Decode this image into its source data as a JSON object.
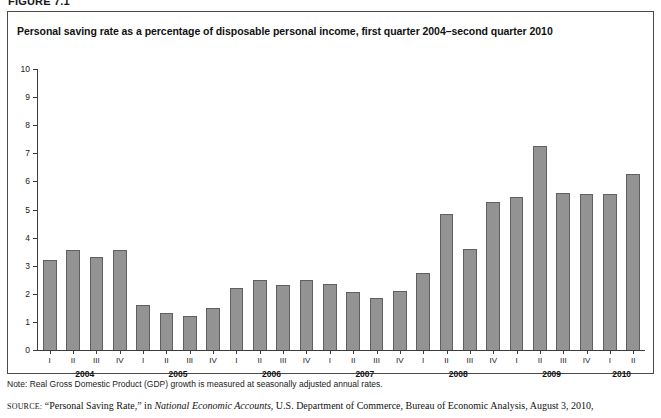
{
  "figure": {
    "label": "FIGURE 7.1",
    "title": "Personal saving rate as a percentage of disposable personal income, first quarter 2004–second quarter 2010"
  },
  "notes": {
    "note": "Note: Real Gross Domestic Product (GDP) growth is measured at seasonally adjusted annual rates.",
    "source_prefix": "SOURCE:",
    "source_part1": " “Personal Saving Rate,” in ",
    "source_italic": "National Economic Accounts",
    "source_part2": ", U.S. Department of Commerce, Bureau of Economic Analysis, August 3, 2010,"
  },
  "colors": {
    "bar_fill": "#939393",
    "bar_stroke": "#606060",
    "axis": "#3c3c3c",
    "panel_border": "#4a4a4a",
    "text": "#111111"
  },
  "chart_data": {
    "type": "bar",
    "title": "Personal saving rate as a percentage of disposable personal income, first quarter 2004–second quarter 2010",
    "xlabel": "",
    "ylabel": "",
    "ylim": [
      0,
      10
    ],
    "ytick_labels": [
      "0",
      "1",
      "2",
      "3",
      "4",
      "5",
      "6",
      "7",
      "8",
      "9",
      "10"
    ],
    "ytick_values": [
      0,
      1,
      2,
      3,
      4,
      5,
      6,
      7,
      8,
      9,
      10
    ],
    "grid": false,
    "legend": "none",
    "quarters": [
      "I",
      "II",
      "III",
      "IV",
      "I",
      "II",
      "III",
      "IV",
      "I",
      "II",
      "III",
      "IV",
      "I",
      "II",
      "III",
      "IV",
      "I",
      "II",
      "III",
      "IV",
      "I",
      "II",
      "III",
      "IV",
      "I",
      "II"
    ],
    "years": [
      {
        "label": "2004",
        "start_index": 0,
        "count": 4
      },
      {
        "label": "2005",
        "start_index": 4,
        "count": 4
      },
      {
        "label": "2006",
        "start_index": 8,
        "count": 4
      },
      {
        "label": "2007",
        "start_index": 12,
        "count": 4
      },
      {
        "label": "2008",
        "start_index": 16,
        "count": 4
      },
      {
        "label": "2009",
        "start_index": 20,
        "count": 4
      },
      {
        "label": "2010",
        "start_index": 24,
        "count": 2
      }
    ],
    "categories": [
      "2004 I",
      "2004 II",
      "2004 III",
      "2004 IV",
      "2005 I",
      "2005 II",
      "2005 III",
      "2005 IV",
      "2006 I",
      "2006 II",
      "2006 III",
      "2006 IV",
      "2007 I",
      "2007 II",
      "2007 III",
      "2007 IV",
      "2008 I",
      "2008 II",
      "2008 III",
      "2008 IV",
      "2009 I",
      "2009 II",
      "2009 III",
      "2009 IV",
      "2010 I",
      "2010 II"
    ],
    "values": [
      3.2,
      3.55,
      3.3,
      3.55,
      1.6,
      1.3,
      1.2,
      1.5,
      2.2,
      2.5,
      2.3,
      2.5,
      2.35,
      2.05,
      1.85,
      2.1,
      2.75,
      4.85,
      3.6,
      5.25,
      5.45,
      7.25,
      5.6,
      5.55,
      5.55,
      6.25
    ]
  }
}
